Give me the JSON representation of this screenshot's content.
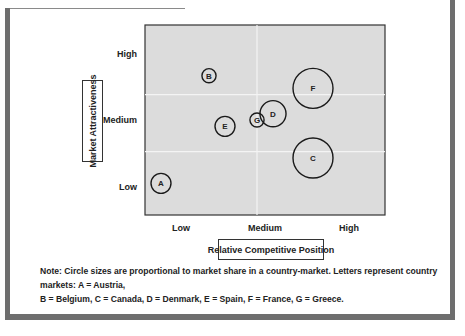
{
  "chart_data": {
    "type": "scatter",
    "subtype": "bubble-matrix",
    "title": "",
    "xlabel": "Relative Competitive Position",
    "ylabel": "Market Attractiveness",
    "x_ticks": [
      "Low",
      "Medium",
      "High"
    ],
    "y_ticks": [
      "High",
      "Medium",
      "Low"
    ],
    "xlim": [
      0,
      3
    ],
    "ylim": [
      0,
      3
    ],
    "grid": true,
    "points": [
      {
        "label": "A",
        "country": "Austria",
        "x": 0.2,
        "y": 0.5,
        "size": 1.0
      },
      {
        "label": "B",
        "country": "Belgium",
        "x": 0.8,
        "y": 2.2,
        "size": 0.5
      },
      {
        "label": "C",
        "country": "Canada",
        "x": 2.1,
        "y": 0.9,
        "size": 4.0
      },
      {
        "label": "D",
        "country": "Denmark",
        "x": 1.6,
        "y": 1.6,
        "size": 1.7
      },
      {
        "label": "E",
        "country": "Spain",
        "x": 1.0,
        "y": 1.4,
        "size": 1.0
      },
      {
        "label": "F",
        "country": "France",
        "x": 2.1,
        "y": 2.0,
        "size": 4.0
      },
      {
        "label": "G",
        "country": "Greece",
        "x": 1.4,
        "y": 1.5,
        "size": 0.5
      }
    ]
  },
  "note_line1": "Note: Circle sizes are proportional to market share in a country-market. Letters represent country markets: A = Austria,",
  "note_line2": "B = Belgium, C = Canada, D = Denmark, E = Spain, F = France, G = Greece.",
  "colors": {
    "plot_bg": "#dcdcdc",
    "grid": "#f4f4f4",
    "frame": "#6e6e6e",
    "stroke": "#1a1a1a"
  }
}
